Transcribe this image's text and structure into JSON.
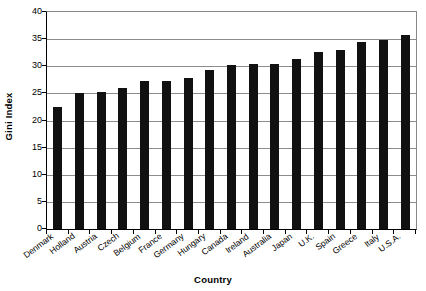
{
  "chart_data": {
    "type": "bar",
    "title": "",
    "xlabel": "Country",
    "ylabel": "Gini Index",
    "categories": [
      "Denmark",
      "Holland",
      "Austria",
      "Czech",
      "Belgium",
      "France",
      "Germany",
      "Hungary",
      "Canada",
      "Ireland",
      "Australia",
      "Japan",
      "U.K.",
      "Spain",
      "Greece",
      "Italy",
      "U.S.A."
    ],
    "values": [
      22.5,
      25.1,
      25.2,
      26.0,
      27.2,
      27.3,
      27.8,
      29.4,
      30.2,
      30.4,
      30.5,
      31.4,
      32.6,
      33.0,
      34.5,
      34.8,
      35.7
    ],
    "series": [
      {
        "name": "Gini Index",
        "values": [
          22.5,
          25.1,
          25.2,
          26.0,
          27.2,
          27.3,
          27.8,
          29.4,
          30.2,
          30.4,
          30.5,
          31.4,
          32.6,
          33.0,
          34.5,
          34.8,
          35.7
        ]
      }
    ],
    "ylim": [
      0,
      40
    ],
    "yticks": [
      0,
      5,
      10,
      15,
      20,
      25,
      30,
      35,
      40
    ],
    "ytick_labels": [
      "0",
      "5",
      "10",
      "15",
      "20",
      "25",
      "30",
      "35",
      "40"
    ],
    "grid": "horizontal",
    "legend": "none",
    "bar_color": "#111111",
    "gridline_color": "#8c8c8c",
    "axis_color": "#000000",
    "background": "#ffffff"
  }
}
